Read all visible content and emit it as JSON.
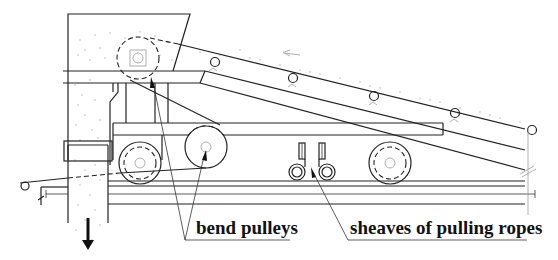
{
  "diagram": {
    "type": "mechanical-cross-section",
    "colors": {
      "line": "#222222",
      "background": "#ffffff",
      "stipple": "#aaaaaa",
      "label": "#111111"
    },
    "labels": {
      "bend_pulleys": "bend pulleys",
      "sheaves": "sheaves of pulling ropes"
    },
    "components": [
      {
        "id": "hopper",
        "name": "discharge hopper / chute"
      },
      {
        "id": "upper-bend-pulley",
        "name": "bend pulley (upper, dashed)"
      },
      {
        "id": "lower-bend-pulley",
        "name": "bend pulley (lower)"
      },
      {
        "id": "left-wheel",
        "name": "carriage wheel (left)"
      },
      {
        "id": "right-wheel",
        "name": "carriage wheel (right)"
      },
      {
        "id": "sheave-left",
        "name": "rope sheave (left)"
      },
      {
        "id": "sheave-right",
        "name": "rope sheave (right)"
      },
      {
        "id": "inclined-conveyor",
        "name": "inclined belt conveyor with idlers"
      },
      {
        "id": "rail",
        "name": "rail track"
      },
      {
        "id": "discharge-arrow",
        "name": "material discharge direction arrow"
      },
      {
        "id": "belt-direction-arrow",
        "name": "belt travel direction arrow"
      }
    ],
    "idler_count": 5
  }
}
